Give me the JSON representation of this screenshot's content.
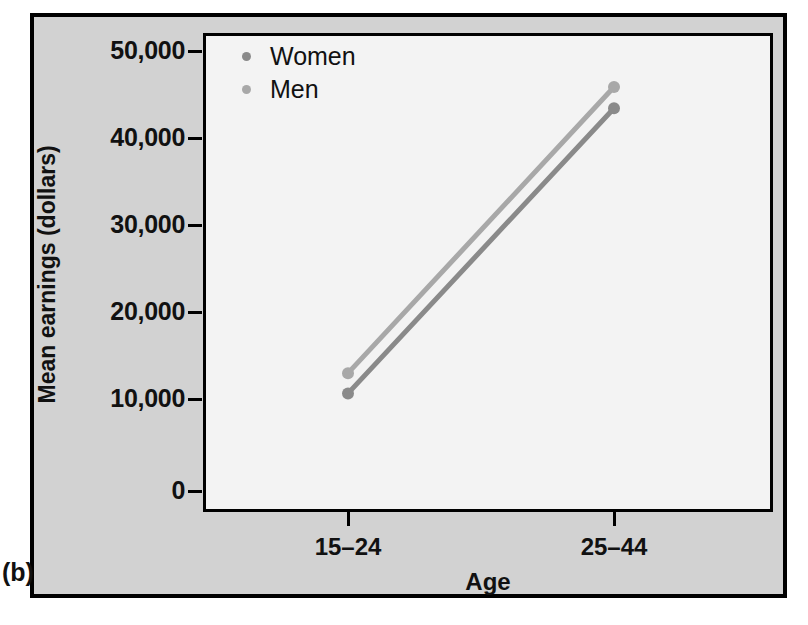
{
  "figure": {
    "panel_label": "(b)",
    "background_color": "#d2d2d2",
    "plot_background_color": "#f3f3f3",
    "frame_color": "#000000"
  },
  "legend": {
    "position": "top-left inside plot",
    "entries": [
      {
        "label": "Women",
        "color": "#8a8a8a",
        "marker": "dot"
      },
      {
        "label": "Men",
        "color": "#a8a8a8",
        "marker": "dot"
      }
    ]
  },
  "axes": {
    "y": {
      "title": "Mean earnings (dollars)",
      "ticks": [
        "50,000",
        "40,000",
        "30,000",
        "20,000",
        "10,000",
        "0"
      ],
      "tick_values": [
        50000,
        40000,
        30000,
        20000,
        10000,
        0
      ],
      "min": 0,
      "max": 52500
    },
    "x": {
      "title": "Age",
      "ticks": [
        "15–24",
        "25–44"
      ]
    }
  },
  "chart_data": {
    "type": "line",
    "title": "",
    "subtitle": "",
    "xlabel": "Age",
    "ylabel": "Mean earnings (dollars)",
    "categories": [
      "15–24",
      "25–44"
    ],
    "series": [
      {
        "name": "Women",
        "values": [
          10500,
          41500
        ],
        "color": "#8a8a8a"
      },
      {
        "name": "Men",
        "values": [
          12700,
          43800
        ],
        "color": "#a8a8a8"
      }
    ],
    "ylim": [
      0,
      52500
    ],
    "ytick_values": [
      0,
      10000,
      20000,
      30000,
      40000,
      50000
    ],
    "ytick_labels": [
      "0",
      "10,000",
      "20,000",
      "30,000",
      "40,000",
      "50,000"
    ],
    "grid": false,
    "legend_position": "top-left",
    "markers": "filled-circle",
    "panel_label": "(b)"
  }
}
